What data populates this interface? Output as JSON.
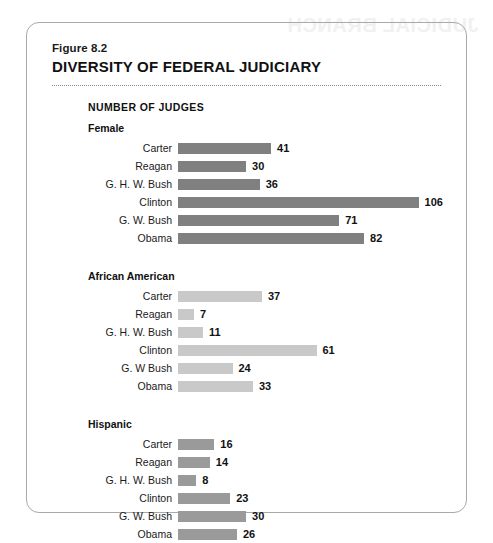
{
  "bleed_text": "JUDICIAL BRANCH",
  "figure": {
    "number": "Figure 8.2",
    "title": "DIVERSITY OF FEDERAL JUDICIARY"
  },
  "chart_data": {
    "type": "bar",
    "orientation": "horizontal",
    "title": "DIVERSITY OF FEDERAL JUDICIARY",
    "subtitle": "Figure 8.2",
    "axis_heading": "NUMBER OF JUDGES",
    "xlabel": "",
    "ylabel": "",
    "xlim": [
      0,
      106
    ],
    "grid": false,
    "legend": "none",
    "value_labels": true,
    "categories": [
      "Carter",
      "Reagan",
      "G. H. W. Bush",
      "Clinton",
      "G. W. Bush",
      "Obama"
    ],
    "series": [
      {
        "name": "Female",
        "color": "#808080",
        "categories": [
          "Carter",
          "Reagan",
          "G. H. W. Bush",
          "Clinton",
          "G. W. Bush",
          "Obama"
        ],
        "values": [
          41,
          30,
          36,
          106,
          71,
          82
        ]
      },
      {
        "name": "African American",
        "color": "#c9c9c9",
        "categories": [
          "Carter",
          "Reagan",
          "G. H. W. Bush",
          "Clinton",
          "G. W Bush",
          "Obama"
        ],
        "values": [
          37,
          7,
          11,
          61,
          24,
          33
        ]
      },
      {
        "name": "Hispanic",
        "color": "#9a9a9a",
        "categories": [
          "Carter",
          "Reagan",
          "G. H. W. Bush",
          "Clinton",
          "G. W. Bush",
          "Obama"
        ],
        "values": [
          16,
          14,
          8,
          23,
          30,
          26
        ]
      }
    ]
  }
}
